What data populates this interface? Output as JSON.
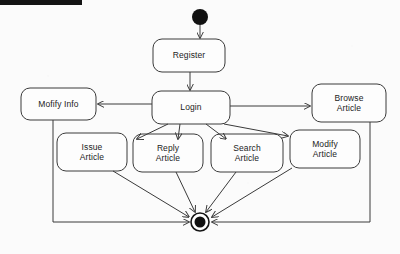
{
  "diagram": {
    "type": "uml-state-diagram",
    "title": "",
    "background_color": "#fbfbfb",
    "stroke_color": "#3a3a3a",
    "fill_color": "#fdfdfd",
    "text_color": "#1c1c1c",
    "header_bar_color": "#141414",
    "nodes": [
      {
        "id": "initial",
        "kind": "initial-node",
        "label": "",
        "cx": 200,
        "cy": 17,
        "r": 8
      },
      {
        "id": "register",
        "kind": "state",
        "label": "Register",
        "x": 153,
        "y": 39,
        "w": 72,
        "h": 33
      },
      {
        "id": "login",
        "kind": "state",
        "label": "Login",
        "x": 152,
        "y": 91,
        "w": 78,
        "h": 33
      },
      {
        "id": "modify-info",
        "kind": "state",
        "label": "Mofify Info",
        "x": 21,
        "y": 88,
        "w": 75,
        "h": 32
      },
      {
        "id": "browse-article",
        "kind": "state",
        "label": "Browse\nArticle",
        "x": 312,
        "y": 84,
        "w": 74,
        "h": 38
      },
      {
        "id": "issue-article",
        "kind": "state",
        "label": "Issue\nArticle",
        "x": 57,
        "y": 133,
        "w": 70,
        "h": 38
      },
      {
        "id": "reply-article",
        "kind": "state",
        "label": "Reply\nArticle",
        "x": 133,
        "y": 134,
        "w": 70,
        "h": 38
      },
      {
        "id": "search-article",
        "kind": "state",
        "label": "Search\nArticle",
        "x": 211,
        "y": 134,
        "w": 72,
        "h": 38
      },
      {
        "id": "modify-article",
        "kind": "state",
        "label": "Modify\nArticle",
        "x": 290,
        "y": 130,
        "w": 70,
        "h": 38
      },
      {
        "id": "final",
        "kind": "final-node",
        "label": "",
        "cx": 200,
        "cy": 222,
        "r_outer": 9,
        "r_inner": 5.5
      }
    ],
    "transitions": [
      {
        "from": "initial",
        "to": "register",
        "label": ""
      },
      {
        "from": "register",
        "to": "login",
        "label": ""
      },
      {
        "from": "login",
        "to": "modify-info",
        "label": ""
      },
      {
        "from": "login",
        "to": "browse-article",
        "label": ""
      },
      {
        "from": "login",
        "to": "issue-article",
        "label": ""
      },
      {
        "from": "login",
        "to": "reply-article",
        "label": ""
      },
      {
        "from": "login",
        "to": "search-article",
        "label": ""
      },
      {
        "from": "login",
        "to": "modify-article",
        "label": ""
      },
      {
        "from": "modify-info",
        "to": "final",
        "label": ""
      },
      {
        "from": "issue-article",
        "to": "final",
        "label": ""
      },
      {
        "from": "reply-article",
        "to": "final",
        "label": ""
      },
      {
        "from": "search-article",
        "to": "final",
        "label": ""
      },
      {
        "from": "modify-article",
        "to": "final",
        "label": ""
      },
      {
        "from": "browse-article",
        "to": "final",
        "label": ""
      }
    ]
  }
}
